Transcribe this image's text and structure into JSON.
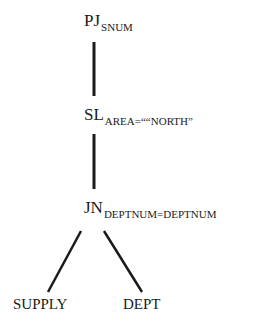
{
  "tree": {
    "root": {
      "op": "PJ",
      "subscript": "SNUM"
    },
    "select": {
      "op": "SL",
      "subscript": "AREA=““NORTH”"
    },
    "join": {
      "op": "JN",
      "subscript": "DEPTNUM=DEPTNUM"
    },
    "leaves": [
      {
        "label": "SUPPLY"
      },
      {
        "label": "DEPT"
      }
    ]
  },
  "colors": {
    "ink": "#1a1a1a",
    "background": "#ffffff"
  }
}
